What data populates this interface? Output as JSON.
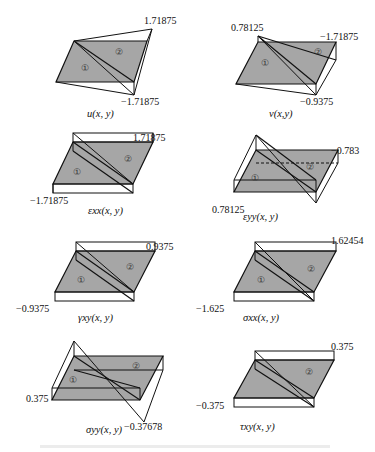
{
  "figure": {
    "panels": [
      {
        "id": "u",
        "caption": "u(x, y)",
        "max_label": "1.71875",
        "min_label": "−1.71875",
        "region1": "①",
        "region2": "②"
      },
      {
        "id": "v",
        "caption": "v(x,y)",
        "max_label": "0.78125",
        "min_label": "−0.9375",
        "extra_label": "−1.71875",
        "region1": "①",
        "region2": "②"
      },
      {
        "id": "eps_xx",
        "caption": "εxx(x, y)",
        "max_label": "1.71875",
        "min_label": "−1.71875",
        "region1": "①",
        "region2": "②"
      },
      {
        "id": "eps_yy",
        "caption": "εyy(x, y)",
        "max_label": "0.78125",
        "min_label": "−0.783",
        "region1": "①",
        "region2": "②"
      },
      {
        "id": "gamma_xy",
        "caption": "γxy(x, y)",
        "max_label": "0.9375",
        "min_label": "−0.9375",
        "region1": "①",
        "region2": "②"
      },
      {
        "id": "sigma_xx",
        "caption": "σxx(x, y)",
        "max_label": "1.62454",
        "min_label": "−1.625",
        "region1": "①",
        "region2": "②"
      },
      {
        "id": "sigma_yy",
        "caption": "σyy(x, y)",
        "max_label": "0.375",
        "min_label": "−0.37678",
        "region1": "①",
        "region2": "②"
      },
      {
        "id": "tau_xy",
        "caption": "τxy(x, y)",
        "max_label": "0.375",
        "min_label": "−0.375",
        "region1": "①",
        "region2": "②"
      }
    ],
    "colors": {
      "fill": "#a6a6a6",
      "stroke": "#111111"
    }
  }
}
